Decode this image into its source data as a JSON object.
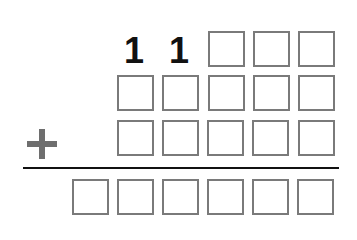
{
  "puzzle": {
    "operator": "+",
    "rows": [
      {
        "cells": [
          "",
          "",
          "1",
          "1",
          "",
          "",
          ""
        ]
      },
      {
        "cells": [
          "",
          "",
          "",
          "",
          "",
          "",
          ""
        ]
      },
      {
        "cells": [
          "",
          "",
          "",
          "",
          "",
          "",
          ""
        ]
      }
    ],
    "given_digits": {
      "row1_col1": "1",
      "row1_col2": "1"
    },
    "addend1": {
      "digits": [
        "1",
        "1",
        "",
        "",
        ""
      ],
      "blank_count": 3
    },
    "addend2": {
      "blank_count": 5
    },
    "addend3": {
      "blank_count": 5
    },
    "sum": {
      "blank_count": 6
    }
  }
}
